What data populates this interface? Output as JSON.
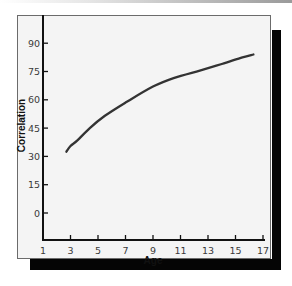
{
  "chart_data": {
    "type": "line",
    "title": "",
    "xlabel": "Age",
    "ylabel": "Correlation",
    "xlim": [
      1,
      17
    ],
    "ylim": [
      0,
      100
    ],
    "x_ticks": [
      1,
      3,
      5,
      7,
      9,
      11,
      13,
      15,
      17
    ],
    "x_tick_labels": [
      "1",
      "3",
      "5",
      "7",
      "9",
      "11",
      "13",
      "15",
      "17"
    ],
    "y_ticks": [
      0,
      15,
      30,
      45,
      60,
      75,
      90
    ],
    "y_tick_labels": [
      "0",
      "15",
      "30",
      "45",
      "60",
      "75",
      "90"
    ],
    "grid": false,
    "legend": "none",
    "series": [
      {
        "name": "Correlation by age",
        "color": "#333333",
        "x": [
          2.7,
          3.0,
          3.5,
          4.4,
          5.5,
          7.0,
          9.0,
          10.5,
          12.4,
          14.0,
          15.5,
          16.3
        ],
        "y": [
          32.5,
          35.5,
          38.5,
          45,
          51.5,
          58.5,
          67,
          71.5,
          75.5,
          79,
          82.5,
          84
        ]
      }
    ]
  }
}
